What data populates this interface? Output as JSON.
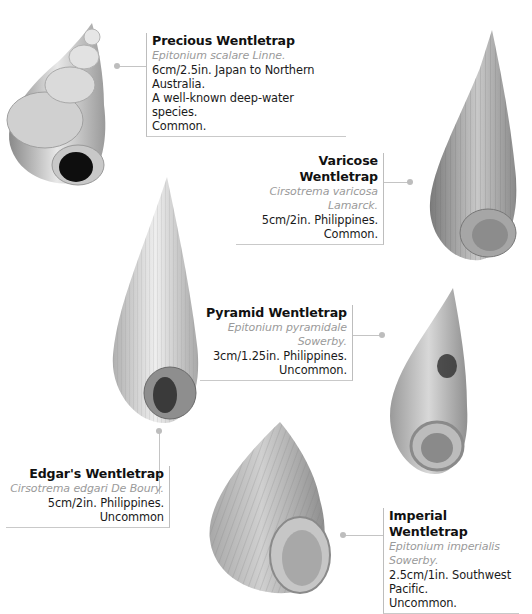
{
  "species": [
    {
      "id": "precious",
      "name": "Precious Wentletrap",
      "scientific": "Epitonium scalare Linne.",
      "details": [
        "6cm/2.5in. Japan to Northern Australia.",
        "A well-known deep-water species.",
        "Common."
      ]
    },
    {
      "id": "varicose",
      "name": "Varicose Wentletrap",
      "scientific": "Cirsotrema varicosa Lamarck.",
      "details": [
        "5cm/2in. Philippines.",
        "Common."
      ]
    },
    {
      "id": "pyramid",
      "name": "Pyramid Wentletrap",
      "scientific": "Epitonium pyramidale Sowerby.",
      "details": [
        "3cm/1.25in. Philippines.",
        "Uncommon."
      ]
    },
    {
      "id": "edgars",
      "name": "Edgar's Wentletrap",
      "scientific": "Cirsotrema edgari De Boury.",
      "details": [
        "5cm/2in. Philippines.",
        "Uncommon"
      ]
    },
    {
      "id": "imperial",
      "name": "Imperial Wentletrap",
      "scientific": "Epitonium imperialis Sowerby.",
      "details": [
        "2.5cm/1in. Southwest Pacific.",
        "Uncommon."
      ]
    }
  ],
  "colors": {
    "caption_rule": "#c4c4c4",
    "scientific_text": "#9a9a9a",
    "name_text": "#111111"
  }
}
